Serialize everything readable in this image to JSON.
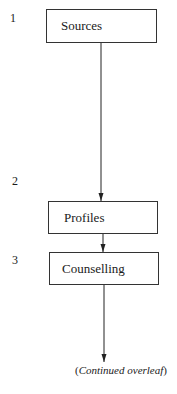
{
  "diagram": {
    "type": "flowchart",
    "steps": [
      {
        "number": "1",
        "label": "Sources"
      },
      {
        "number": "2",
        "label": "Profiles"
      },
      {
        "number": "3",
        "label": "Counselling"
      }
    ],
    "caption": {
      "open": "(",
      "text": "Continued overleaf",
      "close": ")"
    }
  }
}
